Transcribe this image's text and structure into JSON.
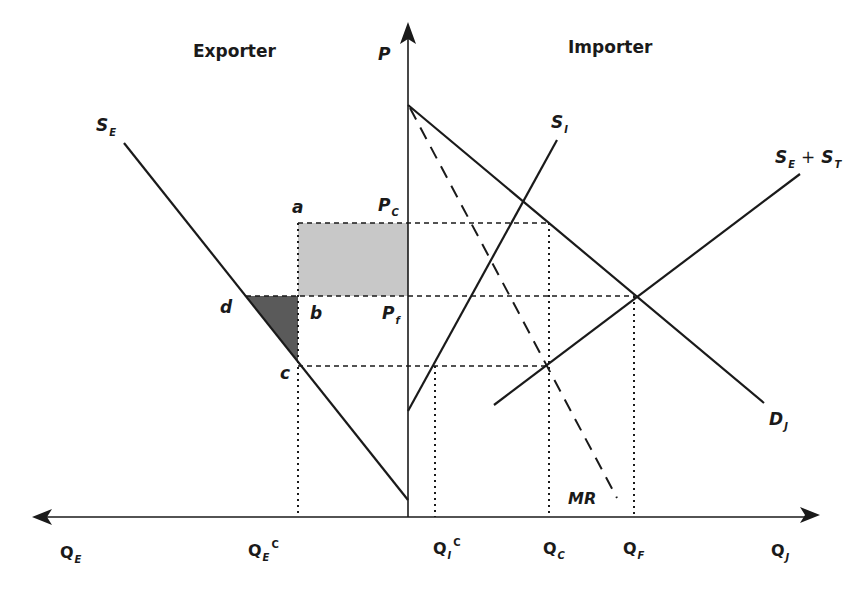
{
  "panels": {
    "left_title": "Exporter",
    "right_title": "Importer"
  },
  "axes": {
    "vertical": {
      "label": "P"
    },
    "horizontal_left": {
      "label": "Q",
      "sub": "E"
    },
    "horizontal_right": {
      "label": "Q",
      "sub": "J"
    }
  },
  "curves": {
    "S_E": {
      "label": "S",
      "sub": "E"
    },
    "S_I": {
      "label": "S",
      "sub": "I"
    },
    "S_E_plus_S_T": {
      "label_a": "S",
      "sub_a": "E",
      "plus": "+",
      "label_b": "S",
      "sub_b": "T"
    },
    "D_J": {
      "label": "D",
      "sub": "J"
    },
    "MR": {
      "label": "MR"
    }
  },
  "price_levels": {
    "P_C": {
      "label": "P",
      "sub": "C"
    },
    "P_f": {
      "label": "P",
      "sub": "f"
    }
  },
  "points": {
    "a": "a",
    "b": "b",
    "c": "c",
    "d": "d"
  },
  "quantity_ticks": {
    "Q_E_C": {
      "label": "Q",
      "sub": "E",
      "sup": "C"
    },
    "Q_I_C": {
      "label": "Q",
      "sub": "I",
      "sup": "C"
    },
    "Q_C": {
      "label": "Q",
      "sub": "C"
    },
    "Q_F": {
      "label": "Q",
      "sub": "F"
    }
  },
  "colors": {
    "line": "#1a1a1a",
    "light_shade": "#c8c8c8",
    "dark_shade": "#5a5a5a"
  },
  "geometry": {
    "origin": [
      408,
      517
    ],
    "P_C_y": 223,
    "P_f_y": 296,
    "c_y": 366,
    "a_x": 298,
    "Q_I_C_x": 435,
    "Q_C_x": 549,
    "Q_F_x": 634
  }
}
